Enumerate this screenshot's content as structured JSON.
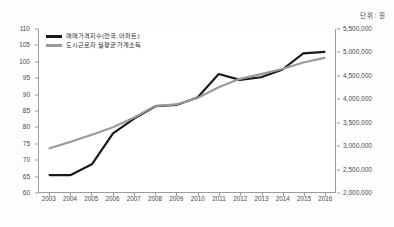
{
  "unit_caption": "단위 : 원",
  "legend": {
    "items": [
      {
        "label": "매매가격지수(전국, 아파트)",
        "color": "#1a1a1a"
      },
      {
        "label": "도시근로자 월평균 가계소득",
        "color": "#9a9a9a"
      }
    ]
  },
  "chart_data": {
    "type": "line",
    "title": "",
    "subtitle": "",
    "xlabel": "",
    "ylabel": "",
    "annotations": [
      "단위 : 원"
    ],
    "grid": false,
    "legend_position": "inside-top-left",
    "categories": [
      "2003",
      "2004",
      "2005",
      "2006",
      "2007",
      "2008",
      "2009",
      "2010",
      "2011",
      "2012",
      "2013",
      "2014",
      "2015",
      "2016"
    ],
    "axes": {
      "left": {
        "name": "매매가격지수",
        "min": 60,
        "max": 110,
        "step": 5,
        "ticks": [
          110,
          105,
          100,
          95,
          90,
          85,
          80,
          75,
          70,
          65,
          60
        ],
        "tick_labels": [
          "110",
          "105",
          "100",
          "95",
          "90",
          "85",
          "80",
          "75",
          "70",
          "65",
          "60"
        ]
      },
      "right": {
        "name": "도시근로자 월평균 가계소득",
        "min": 2000000,
        "max": 5500000,
        "step": 500000,
        "ticks": [
          5500000,
          5000000,
          4500000,
          4000000,
          3500000,
          3000000,
          2500000,
          2000000
        ],
        "tick_labels": [
          "5,500,000",
          "5,000,000",
          "4,500,000",
          "4,000,000",
          "3,500,000",
          "3,000,000",
          "2,500,000",
          "2,000,000"
        ]
      }
    },
    "series": [
      {
        "name": "매매가격지수(전국, 아파트)",
        "color": "#1a1a1a",
        "axis": "left",
        "values": [
          65.2,
          65.2,
          68.5,
          78.0,
          82.5,
          86.3,
          86.7,
          89.0,
          96.2,
          94.4,
          95.2,
          97.5,
          102.5,
          103.0
        ]
      },
      {
        "name": "도시근로자 월평균 가계소득",
        "color": "#9a9a9a",
        "axis": "right",
        "values": [
          2940000,
          3080000,
          3230000,
          3390000,
          3600000,
          3850000,
          3880000,
          4020000,
          4250000,
          4430000,
          4530000,
          4640000,
          4780000,
          4880000
        ]
      }
    ]
  }
}
